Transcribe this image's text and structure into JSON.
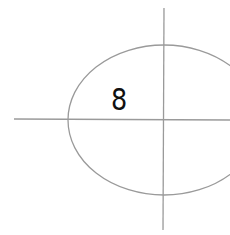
{
  "diagram": {
    "type": "ellipse-with-axes",
    "label": "8",
    "label_pos": {
      "x": 111,
      "y": 85
    },
    "ellipse": {
      "cx": 164,
      "cy": 120,
      "rx": 96,
      "ry": 75
    },
    "h_axis": {
      "x1": 14,
      "y1": 119,
      "x2": 230,
      "y2": 120
    },
    "v_axis": {
      "x1": 164,
      "y1": 8,
      "x2": 163,
      "y2": 230
    },
    "stroke_color": "#9a9a9a",
    "stroke_width": 1.3
  }
}
